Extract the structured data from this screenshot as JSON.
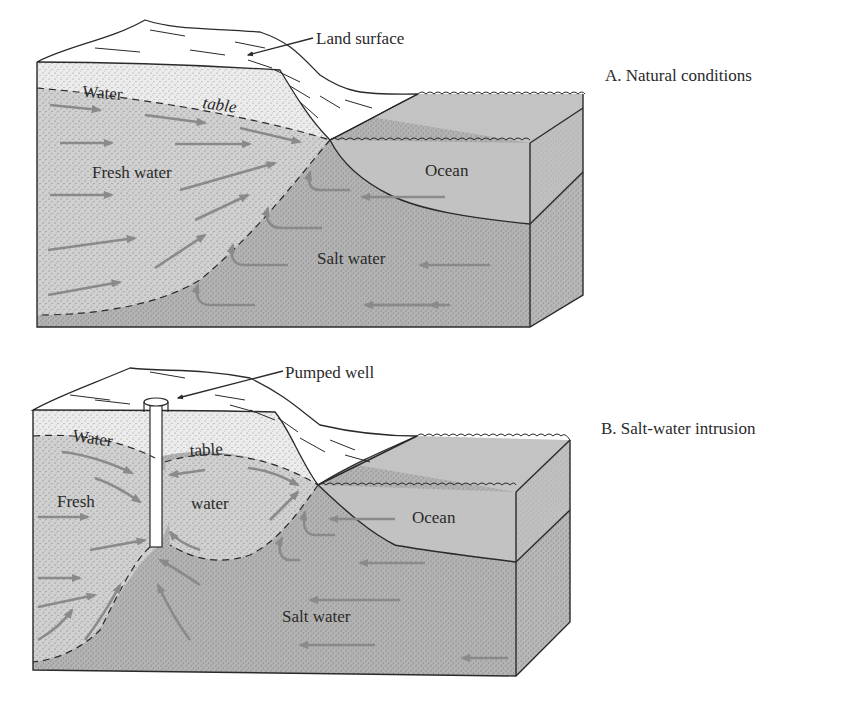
{
  "colors": {
    "background": "#ffffff",
    "land": "#ffffff",
    "unsaturated": "#e6e6e6",
    "fresh_water": "#cfcfcf",
    "salt_water": "#b3b3b3",
    "ocean": "#bdbdbd",
    "arrow": "#8a8a8a",
    "line": "#2a2a2a"
  },
  "panel_a": {
    "caption": "A.  Natural conditions",
    "labels": {
      "land_surface": "Land surface",
      "water": "Water",
      "table": "table",
      "fresh_water": "Fresh water",
      "ocean": "Ocean",
      "salt_water": "Salt water"
    }
  },
  "panel_b": {
    "caption": "B.  Salt-water intrusion",
    "labels": {
      "pumped_well": "Pumped well",
      "water": "Water",
      "table": "table",
      "fresh": "Fresh",
      "water2": "water",
      "ocean": "Ocean",
      "salt_water": "Salt water"
    }
  }
}
